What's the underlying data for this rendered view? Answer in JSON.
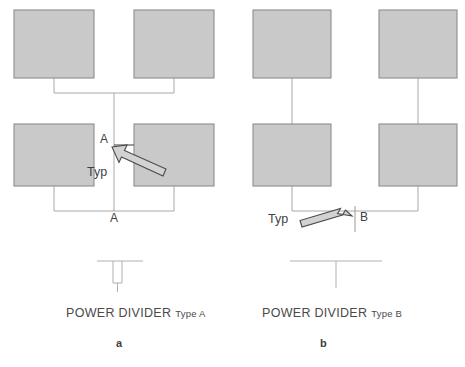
{
  "figure": {
    "panels": [
      {
        "id": "panel-a",
        "index_label": "a",
        "caption_main": "POWER DIVIDER",
        "caption_sub": "Type A",
        "section_label_top": "A",
        "section_label_bottom": "A",
        "callout_label": "Typ",
        "symbol_type": "stub-tee",
        "connector_style": "h-bridge-top-and-bottom",
        "boxes": [
          {
            "name": "top-left-unit",
            "x": 14,
            "y": 10,
            "w": 80,
            "h": 68
          },
          {
            "name": "top-right-unit",
            "x": 134,
            "y": 10,
            "w": 80,
            "h": 68
          },
          {
            "name": "bottom-left-unit",
            "x": 14,
            "y": 124,
            "w": 80,
            "h": 62
          },
          {
            "name": "bottom-right-unit",
            "x": 134,
            "y": 124,
            "w": 80,
            "h": 62
          }
        ]
      },
      {
        "id": "panel-b",
        "index_label": "b",
        "caption_main": "POWER DIVIDER",
        "caption_sub": "Type B",
        "section_label_top": "",
        "section_label_bottom": "B",
        "callout_label": "Typ",
        "symbol_type": "plain-tee",
        "connector_style": "straight-verticals-bottom-bridge",
        "boxes": [
          {
            "name": "top-left-unit",
            "x": 253,
            "y": 10,
            "w": 78,
            "h": 68
          },
          {
            "name": "top-right-unit",
            "x": 379,
            "y": 10,
            "w": 78,
            "h": 68
          },
          {
            "name": "bottom-left-unit",
            "x": 253,
            "y": 124,
            "w": 78,
            "h": 62
          },
          {
            "name": "bottom-right-unit",
            "x": 379,
            "y": 124,
            "w": 78,
            "h": 62
          }
        ]
      }
    ],
    "colors": {
      "box_fill": "#c9c9c9",
      "box_stroke": "#8d8d8d",
      "connector": "#a8a8a8",
      "symbol": "#b0b0b0",
      "arrow_fill": "#d2d2d2",
      "arrow_stroke": "#4a4a4a",
      "text": "#3f3f3f",
      "background": "#ffffff"
    }
  }
}
